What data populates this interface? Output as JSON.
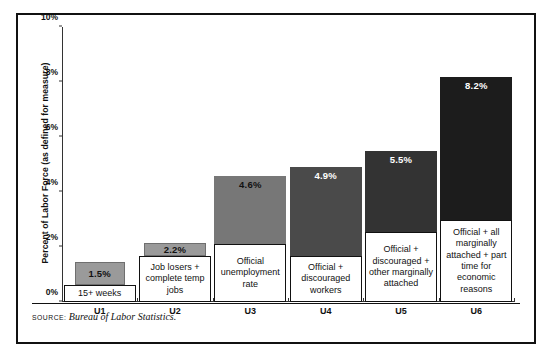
{
  "chart_data": {
    "type": "bar",
    "title": "",
    "xlabel": "",
    "ylabel": "Percent of Labor Force (as defined for measure)",
    "ylim": [
      0,
      10
    ],
    "yticks": [
      "0%",
      "2%",
      "4%",
      "6%",
      "8%",
      "10%"
    ],
    "ytick_values": [
      0,
      2,
      4,
      6,
      8,
      10
    ],
    "grid": false,
    "legend": "none",
    "categories": [
      "U1",
      "U2",
      "U3",
      "U4",
      "U5",
      "U6"
    ],
    "values": [
      1.5,
      2.2,
      4.6,
      4.9,
      5.5,
      8.2
    ],
    "value_labels": [
      "1.5%",
      "2.2%",
      "4.6%",
      "4.9%",
      "5.5%",
      "8.2%"
    ],
    "bar_descriptions": [
      "15+ weeks",
      "Job losers + complete temp jobs",
      "Official unemployment rate",
      "Official + discouraged workers",
      "Official + discouraged + other marginally attached",
      "Official + all marginally attached + part time for economic reasons"
    ],
    "bar_colors": [
      "#9a9a9a",
      "#9a9a9a",
      "#777777",
      "#4a4a4a",
      "#333333",
      "#1c1c1c"
    ],
    "label_text_colors": [
      "#111111",
      "#111111",
      "#111111",
      "#ffffff",
      "#ffffff",
      "#ffffff"
    ]
  },
  "source": {
    "label": "Source:",
    "text": "Bureau of Labor Statistics."
  }
}
